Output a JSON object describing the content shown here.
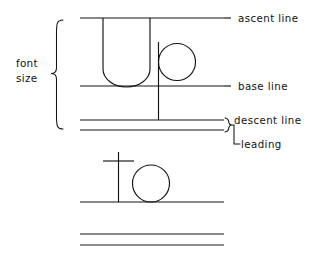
{
  "diagram": {
    "labels": {
      "ascent_line": "ascent line",
      "base_line": "base line",
      "descent_line": "descent line",
      "leading": "leading",
      "font_size_line1": "font",
      "font_size_line2": "size"
    },
    "glyphs": {
      "row1": "Up",
      "row2": "To"
    },
    "colors": {
      "ink": "#141414",
      "text": "#111111",
      "background": "#ffffff"
    },
    "metrics": {
      "ascent_line_y": 18,
      "base_line_y": 86,
      "descent_line_y": 120,
      "leading_line_y": 130,
      "row2_base_line_y": 202,
      "next_line_1_y": 234,
      "next_line_2_y": 245,
      "rule_left_x": 80,
      "rule_right_x": 224
    }
  }
}
